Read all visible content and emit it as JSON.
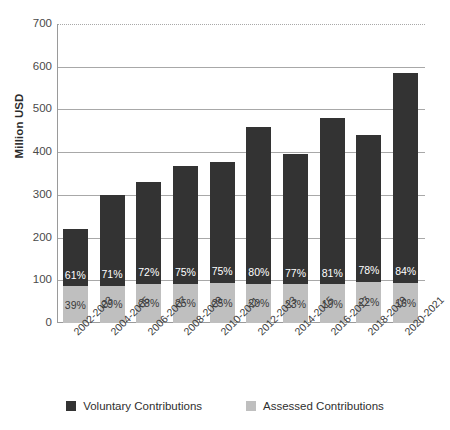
{
  "chart_data": {
    "type": "bar",
    "title": "",
    "subtitle": "",
    "xlabel": "",
    "ylabel": "Million USD",
    "ylim": [
      0,
      700
    ],
    "ytick_step": 100,
    "yticks": [
      0,
      100,
      200,
      300,
      400,
      500,
      600,
      700
    ],
    "ytick_labels": [
      "0",
      "100",
      "200",
      "300",
      "400",
      "500",
      "600",
      "700"
    ],
    "grid": true,
    "stacked": true,
    "legend_position": "bottom",
    "categories": [
      "2002-2003",
      "2004-2005",
      "2006-2007",
      "2008-2009",
      "2010-2011",
      "2012-2013",
      "2014-2015",
      "2016-2017",
      "2018-2019",
      "2020-2021"
    ],
    "series": [
      {
        "name": "Voluntary Contributions",
        "color": "#333333",
        "values": [
          134,
          213,
          238,
          276,
          283,
          366,
          305,
          389,
          343,
          491
        ],
        "labels": [
          "61%",
          "71%",
          "72%",
          "75%",
          "75%",
          "80%",
          "77%",
          "81%",
          "78%",
          "84%"
        ]
      },
      {
        "name": "Assessed Contributions",
        "color": "#bfbfbf",
        "values": [
          86,
          87,
          92,
          92,
          94,
          92,
          91,
          91,
          97,
          94
        ],
        "labels": [
          "39%",
          "29%",
          "28%",
          "25%",
          "25%",
          "20%",
          "23%",
          "19%",
          "22%",
          "16%"
        ]
      }
    ],
    "totals": [
      220,
      300,
      330,
      368,
      377,
      458,
      396,
      480,
      440,
      585
    ]
  },
  "legend": {
    "items": [
      {
        "label": "Voluntary Contributions",
        "color": "#333333"
      },
      {
        "label": "Assessed Contributions",
        "color": "#bfbfbf"
      }
    ]
  }
}
